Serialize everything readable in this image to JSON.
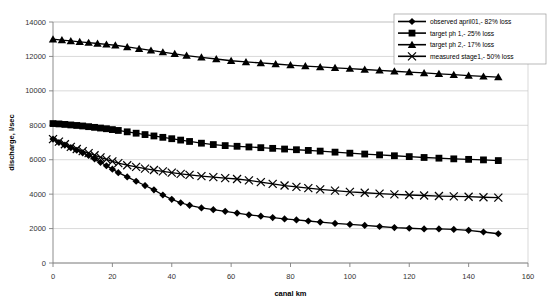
{
  "chart_data": {
    "type": "line",
    "title": "",
    "xlabel": "canal km",
    "ylabel": "discharge, l/sec",
    "xlim": [
      0,
      160
    ],
    "ylim": [
      0,
      14000
    ],
    "xticks": [
      0,
      20,
      40,
      60,
      80,
      100,
      120,
      140,
      160
    ],
    "yticks": [
      0,
      2000,
      4000,
      6000,
      8000,
      10000,
      12000,
      14000
    ],
    "grid": true,
    "legend_position": "top-right",
    "series": [
      {
        "name": "observed april01,- 82% loss",
        "marker": "diamond",
        "color": "#000000",
        "x": [
          0,
          2,
          4,
          6,
          8,
          10,
          12,
          14,
          16,
          18,
          20,
          22,
          25,
          28,
          31,
          34,
          37,
          40,
          43,
          46,
          50,
          54,
          58,
          62,
          66,
          70,
          74,
          78,
          82,
          86,
          90,
          95,
          100,
          105,
          110,
          115,
          120,
          125,
          130,
          135,
          140,
          145,
          150
        ],
        "y": [
          7200,
          7000,
          6850,
          6700,
          6550,
          6400,
          6250,
          6050,
          5850,
          5650,
          5450,
          5250,
          5000,
          4750,
          4500,
          4250,
          3950,
          3700,
          3500,
          3350,
          3200,
          3100,
          3000,
          2900,
          2800,
          2720,
          2640,
          2560,
          2500,
          2440,
          2380,
          2300,
          2240,
          2180,
          2120,
          2060,
          2020,
          1980,
          1980,
          1950,
          1900,
          1800,
          1700
        ]
      },
      {
        "name": "target ph 1,- 25% loss",
        "marker": "square",
        "color": "#000000",
        "x": [
          0,
          2,
          4,
          6,
          8,
          10,
          12,
          14,
          16,
          18,
          20,
          22,
          25,
          28,
          31,
          34,
          37,
          40,
          43,
          46,
          50,
          54,
          58,
          62,
          66,
          70,
          74,
          78,
          82,
          86,
          90,
          95,
          100,
          105,
          110,
          115,
          120,
          125,
          130,
          135,
          140,
          145,
          150
        ],
        "y": [
          8100,
          8080,
          8050,
          8020,
          7990,
          7960,
          7920,
          7880,
          7840,
          7800,
          7750,
          7700,
          7620,
          7540,
          7460,
          7380,
          7300,
          7220,
          7140,
          7060,
          6960,
          6880,
          6820,
          6780,
          6740,
          6700,
          6660,
          6620,
          6580,
          6540,
          6500,
          6440,
          6380,
          6330,
          6280,
          6230,
          6180,
          6130,
          6090,
          6050,
          6020,
          5990,
          5950
        ]
      },
      {
        "name": "target ph 2,- 17% loss",
        "marker": "triangle",
        "color": "#000000",
        "x": [
          0,
          3,
          6,
          9,
          12,
          15,
          18,
          21,
          25,
          29,
          33,
          37,
          41,
          45,
          50,
          55,
          60,
          65,
          70,
          75,
          80,
          85,
          90,
          95,
          100,
          105,
          110,
          115,
          120,
          125,
          130,
          135,
          140,
          145,
          150
        ],
        "y": [
          13000,
          12950,
          12900,
          12850,
          12800,
          12750,
          12700,
          12650,
          12550,
          12450,
          12350,
          12250,
          12150,
          12050,
          11950,
          11850,
          11750,
          11680,
          11620,
          11560,
          11500,
          11440,
          11390,
          11340,
          11290,
          11240,
          11190,
          11140,
          11090,
          11040,
          10990,
          10940,
          10890,
          10840,
          10800
        ]
      },
      {
        "name": "measured stage1,- 50% loss",
        "marker": "cross",
        "color": "#000000",
        "x": [
          0,
          2,
          4,
          6,
          8,
          10,
          12,
          14,
          16,
          18,
          20,
          22,
          25,
          28,
          31,
          34,
          37,
          40,
          43,
          46,
          50,
          54,
          58,
          62,
          66,
          70,
          74,
          78,
          82,
          86,
          90,
          95,
          100,
          105,
          110,
          115,
          120,
          125,
          130,
          135,
          140,
          145,
          150
        ],
        "y": [
          7200,
          7050,
          6900,
          6750,
          6620,
          6500,
          6380,
          6260,
          6140,
          6020,
          5900,
          5800,
          5680,
          5580,
          5480,
          5400,
          5320,
          5250,
          5180,
          5120,
          5050,
          4990,
          4930,
          4880,
          4800,
          4700,
          4600,
          4500,
          4420,
          4350,
          4280,
          4200,
          4130,
          4080,
          4030,
          3990,
          3950,
          3920,
          3890,
          3870,
          3850,
          3820,
          3800
        ]
      }
    ]
  }
}
